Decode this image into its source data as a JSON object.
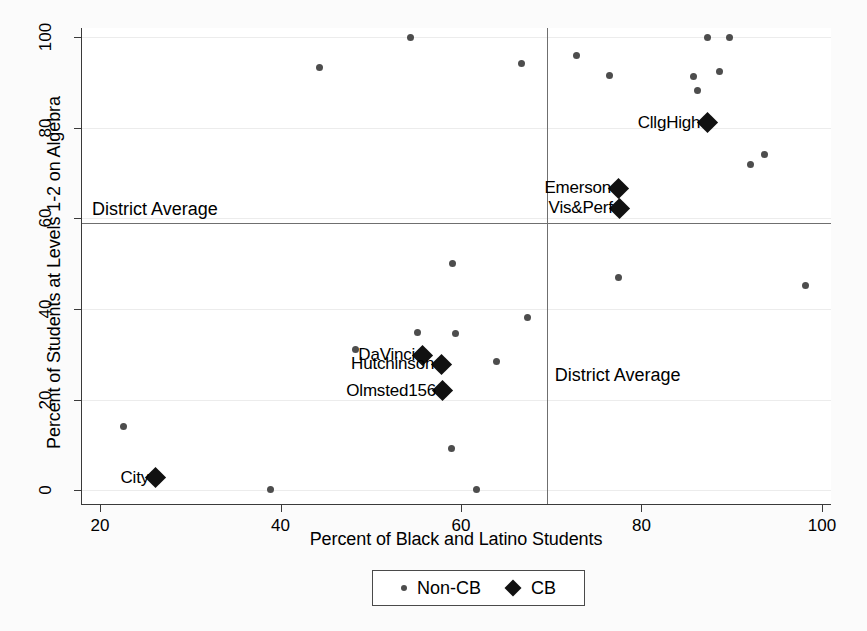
{
  "chart_data": {
    "type": "scatter",
    "title": "",
    "xlabel": "Percent of Black and Latino Students",
    "ylabel": "Percent of Students at Levels 1-2 on Algebra",
    "xlim": [
      18,
      101
    ],
    "ylim": [
      -3,
      102
    ],
    "xticks": [
      20,
      40,
      60,
      80,
      100
    ],
    "yticks": [
      0,
      20,
      40,
      60,
      80,
      100
    ],
    "grid": "horizontal-faint",
    "legend": {
      "position": "below-axis-center",
      "entries": [
        {
          "label": "Non-CB",
          "marker": "small-circle",
          "color": "#4d4d4d"
        },
        {
          "label": "CB",
          "marker": "diamond",
          "color": "#111111"
        }
      ]
    },
    "reference_lines": [
      {
        "orientation": "horizontal",
        "value": 59,
        "label": "District Average",
        "label_position": "left-above"
      },
      {
        "orientation": "vertical",
        "value": 69.5,
        "label": "District Average",
        "label_position": "right-below"
      }
    ],
    "series": [
      {
        "name": "Non-CB",
        "marker": "small-circle",
        "color": "#4d4d4d",
        "points": [
          {
            "x": 22.6,
            "y": 14.2
          },
          {
            "x": 38.9,
            "y": 0.3
          },
          {
            "x": 44.3,
            "y": 93.3
          },
          {
            "x": 48.3,
            "y": 31.1
          },
          {
            "x": 54.4,
            "y": 100.0
          },
          {
            "x": 55.2,
            "y": 34.9
          },
          {
            "x": 58.9,
            "y": 9.2
          },
          {
            "x": 59.1,
            "y": 50.0
          },
          {
            "x": 59.4,
            "y": 34.7
          },
          {
            "x": 61.7,
            "y": 0.2
          },
          {
            "x": 63.9,
            "y": 28.4
          },
          {
            "x": 66.7,
            "y": 94.2
          },
          {
            "x": 67.4,
            "y": 38.2
          },
          {
            "x": 72.8,
            "y": 95.9
          },
          {
            "x": 76.4,
            "y": 91.6
          },
          {
            "x": 77.4,
            "y": 46.9
          },
          {
            "x": 85.8,
            "y": 91.4
          },
          {
            "x": 86.2,
            "y": 88.2
          },
          {
            "x": 87.3,
            "y": 100.0
          },
          {
            "x": 88.6,
            "y": 92.4
          },
          {
            "x": 89.7,
            "y": 100.0
          },
          {
            "x": 92.1,
            "y": 72.0
          },
          {
            "x": 93.6,
            "y": 74.1
          },
          {
            "x": 98.2,
            "y": 45.1
          }
        ]
      },
      {
        "name": "CB",
        "marker": "diamond",
        "color": "#111111",
        "points": [
          {
            "x": 26.2,
            "y": 2.8,
            "label": "City"
          },
          {
            "x": 55.7,
            "y": 29.8,
            "label": "DaVinci"
          },
          {
            "x": 57.8,
            "y": 27.8,
            "label": "Hutchinson"
          },
          {
            "x": 58.0,
            "y": 22.0,
            "label": "Olmsted156"
          },
          {
            "x": 77.4,
            "y": 66.6,
            "label": "Emerson"
          },
          {
            "x": 77.6,
            "y": 62.2,
            "label": "Vis&Perf"
          },
          {
            "x": 87.3,
            "y": 81.1,
            "label": "CllgHigh"
          }
        ]
      }
    ]
  }
}
